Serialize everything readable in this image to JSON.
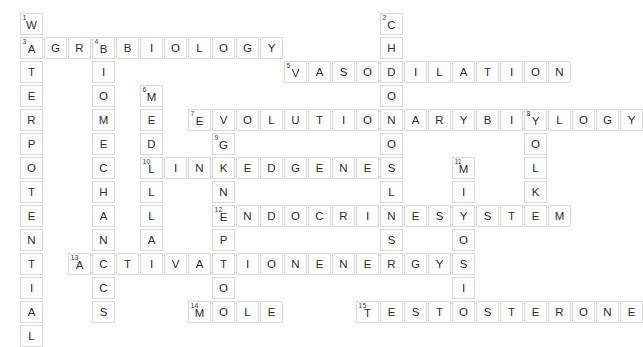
{
  "puzzle": {
    "title": "Biology Crossword Grid",
    "grid": {
      "cell_size": 24,
      "origin_x": 20,
      "origin_y": 13,
      "columns": 24,
      "rows": 13,
      "cell_border_color": "#d8d8d8",
      "cell_fill_color": "#ffffff",
      "letter_color": "#2b2b2b",
      "number_color": "#3a3a3a"
    },
    "entries": [
      {
        "number": "1",
        "answer": "WATERPOTENTIAL",
        "direction": "down",
        "row": 0,
        "col": 0,
        "length": 14
      },
      {
        "number": "2",
        "answer": "CHLOROPLAST",
        "direction": "down",
        "row": 0,
        "col": 15,
        "length": 11
      },
      {
        "number": "3",
        "answer": "AGROBIOLOGY",
        "direction": "across",
        "row": 1,
        "col": 0,
        "length": 11
      },
      {
        "number": "4",
        "answer": "BIOMECHANICS",
        "direction": "down",
        "row": 1,
        "col": 3,
        "length": 12
      },
      {
        "number": "5",
        "answer": "VASODILATION",
        "direction": "across",
        "row": 2,
        "col": 11,
        "length": 12
      },
      {
        "number": "6",
        "answer": "MEDULLA",
        "direction": "down",
        "row": 3,
        "col": 5,
        "length": 7
      },
      {
        "number": "7",
        "answer": "EVOLUTIONARYBIOLOGY",
        "direction": "across",
        "row": 4,
        "col": 7,
        "length": 19
      },
      {
        "number": "8",
        "answer": "YOLK",
        "direction": "down",
        "row": 4,
        "col": 21,
        "length": 4
      },
      {
        "number": "9",
        "answer": "GENEPOOL",
        "direction": "down",
        "row": 5,
        "col": 8,
        "length": 8
      },
      {
        "number": "10",
        "answer": "LINKEDGENES",
        "direction": "across",
        "row": 6,
        "col": 5,
        "length": 11
      },
      {
        "number": "11",
        "answer": "MITOSIS",
        "direction": "down",
        "row": 6,
        "col": 18,
        "length": 7
      },
      {
        "number": "12",
        "answer": "ENDOCRINESYSTEM",
        "direction": "across",
        "row": 8,
        "col": 8,
        "length": 15
      },
      {
        "number": "13",
        "answer": "ACTIVATIONENERGY",
        "direction": "across",
        "row": 10,
        "col": 2,
        "length": 16
      },
      {
        "number": "14",
        "answer": "MOLE",
        "direction": "across",
        "row": 12,
        "col": 7,
        "length": 4
      },
      {
        "number": "15",
        "answer": "TESTOSTERONE",
        "direction": "across",
        "row": 12,
        "col": 14,
        "length": 12
      }
    ]
  }
}
